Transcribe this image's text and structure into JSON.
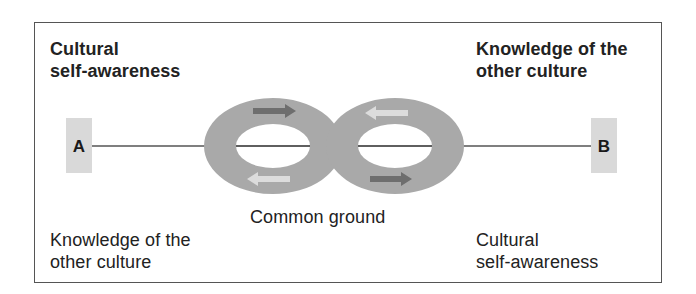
{
  "diagram": {
    "top_left_label": "Cultural\nself-awareness",
    "top_right_label": "Knowledge of the\nother culture",
    "bottom_left_label": "Knowledge of the\nother culture",
    "bottom_right_label": "Cultural\nself-awareness",
    "center_label": "Common ground",
    "node_a": "A",
    "node_b": "B",
    "colors": {
      "ring": "#a9a9a9",
      "node_box": "#d9d9d9",
      "arrow_dark": "#6e6e6e",
      "arrow_light": "#dcdcdc",
      "line": "#555555",
      "frame": "#555555"
    },
    "arrows": [
      {
        "position": "left-ring-top",
        "direction": "right",
        "shade": "dark"
      },
      {
        "position": "right-ring-top",
        "direction": "left",
        "shade": "light"
      },
      {
        "position": "left-ring-bottom",
        "direction": "left",
        "shade": "light"
      },
      {
        "position": "right-ring-bottom",
        "direction": "right",
        "shade": "dark"
      }
    ]
  }
}
